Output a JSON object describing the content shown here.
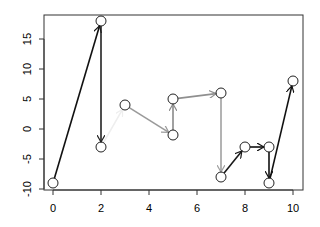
{
  "chart_data": {
    "type": "scatter",
    "title": "",
    "xlabel": "",
    "ylabel": "",
    "xlim": [
      -0.4,
      10.4
    ],
    "ylim": [
      -10.2,
      19.2
    ],
    "grid": false,
    "legend": null,
    "x_ticks": [
      0,
      2,
      4,
      6,
      8,
      10
    ],
    "y_ticks": [
      -10,
      -5,
      0,
      5,
      10,
      15
    ],
    "points": [
      {
        "x": 0,
        "y": -9
      },
      {
        "x": 2,
        "y": 18
      },
      {
        "x": 2,
        "y": -3
      },
      {
        "x": 3,
        "y": 4
      },
      {
        "x": 5,
        "y": -1
      },
      {
        "x": 5,
        "y": 5
      },
      {
        "x": 7,
        "y": 6
      },
      {
        "x": 7,
        "y": -8
      },
      {
        "x": 8,
        "y": -3
      },
      {
        "x": 9,
        "y": -3
      },
      {
        "x": 9,
        "y": -9
      },
      {
        "x": 10,
        "y": 8
      }
    ],
    "arrows": [
      {
        "from": 0,
        "to": 1,
        "color": "#111111"
      },
      {
        "from": 1,
        "to": 2,
        "color": "#222222"
      },
      {
        "from": 2,
        "to": 3,
        "color": "#eeeeee"
      },
      {
        "from": 3,
        "to": 4,
        "color": "#9a9a9a"
      },
      {
        "from": 4,
        "to": 5,
        "color": "#8a8a8a"
      },
      {
        "from": 5,
        "to": 6,
        "color": "#8f8f8f"
      },
      {
        "from": 6,
        "to": 7,
        "color": "#a0a0a0"
      },
      {
        "from": 7,
        "to": 8,
        "color": "#1a1a1a"
      },
      {
        "from": 8,
        "to": 9,
        "color": "#111111"
      },
      {
        "from": 9,
        "to": 10,
        "color": "#111111"
      },
      {
        "from": 10,
        "to": 11,
        "color": "#111111"
      }
    ],
    "annotation": "Sequence of points connected by arrows"
  }
}
